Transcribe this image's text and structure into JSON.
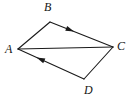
{
  "figure": {
    "width": 135,
    "height": 106,
    "background_color": "#ffffff",
    "stroke_color": "#1a1a1a",
    "stroke_width": 1.1,
    "label_color": "#161616",
    "vertices": [
      {
        "name": "A",
        "label": "A",
        "x": 18,
        "y": 49,
        "label_x": 5,
        "label_y": 43
      },
      {
        "name": "B",
        "label": "B",
        "x": 50,
        "y": 22,
        "label_x": 44,
        "label_y": 1
      },
      {
        "name": "C",
        "label": "C",
        "x": 113,
        "y": 47,
        "label_x": 117,
        "label_y": 40
      },
      {
        "name": "D",
        "label": "D",
        "x": 84,
        "y": 79,
        "label_x": 84,
        "label_y": 84
      }
    ],
    "edges": [
      {
        "name": "edge-AB",
        "from": "A",
        "to": "B",
        "x1": 18,
        "y1": 49,
        "x2": 50,
        "y2": 22,
        "arrow": false
      },
      {
        "name": "edge-BC",
        "from": "B",
        "to": "C",
        "x1": 50,
        "y1": 22,
        "x2": 113,
        "y2": 47,
        "arrow": true,
        "arrow_at": 0.32,
        "arrow_direction": "toward-C"
      },
      {
        "name": "edge-CD",
        "from": "C",
        "to": "D",
        "x1": 113,
        "y1": 47,
        "x2": 84,
        "y2": 79,
        "arrow": false
      },
      {
        "name": "edge-DA",
        "from": "D",
        "to": "A",
        "x1": 84,
        "y1": 79,
        "x2": 18,
        "y2": 49,
        "arrow": true,
        "arrow_at": 0.66,
        "arrow_direction": "toward-A"
      },
      {
        "name": "diagonal-AC",
        "from": "A",
        "to": "C",
        "x1": 18,
        "y1": 49,
        "x2": 113,
        "y2": 47,
        "arrow": false
      }
    ]
  }
}
